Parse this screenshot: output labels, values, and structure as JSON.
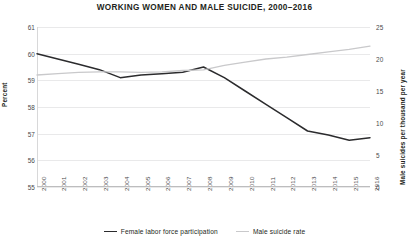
{
  "chart_data": {
    "type": "line",
    "title": "WORKING WOMEN AND MALE SUICIDE, 2000–2016",
    "xlabel": "",
    "ylabel": "Percent",
    "y2label": "Male suicides per thousand per year",
    "categories": [
      "2000",
      "2001",
      "2002",
      "2003",
      "2004",
      "2005",
      "2006",
      "2007",
      "2008",
      "2009",
      "2010",
      "2011",
      "2012",
      "2013",
      "2014",
      "2015",
      "2016"
    ],
    "ylim": [
      55,
      61
    ],
    "yticks": [
      55,
      56,
      57,
      58,
      59,
      60,
      61
    ],
    "y2lim": [
      0,
      25
    ],
    "y2ticks": [
      0,
      5,
      10,
      15,
      20,
      25
    ],
    "grid": true,
    "legend_position": "bottom",
    "series": [
      {
        "name": "Female labor force participation",
        "axis": "left",
        "color": "#2b2b2d",
        "values": [
          60.0,
          59.8,
          59.6,
          59.4,
          59.1,
          59.2,
          59.25,
          59.3,
          59.5,
          59.1,
          58.6,
          58.1,
          57.6,
          57.1,
          56.95,
          56.75,
          56.85
        ]
      },
      {
        "name": "Male suicide rate",
        "axis": "right",
        "color": "#c9c9cb",
        "values": [
          17.5,
          17.7,
          17.9,
          18.0,
          18.0,
          17.9,
          18.0,
          18.2,
          18.3,
          19.0,
          19.5,
          20.0,
          20.3,
          20.7,
          21.1,
          21.5,
          22.0
        ]
      }
    ]
  },
  "legend": {
    "items": [
      {
        "label": "Female labor force participation",
        "color": "#2b2b2d"
      },
      {
        "label": "Male suicide rate",
        "color": "#c9c9cb"
      }
    ]
  }
}
